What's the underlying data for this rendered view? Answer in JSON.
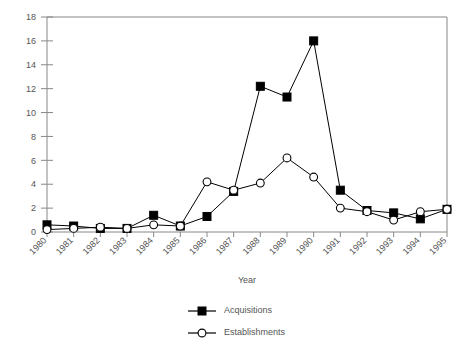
{
  "chart_data": {
    "type": "line",
    "title": "",
    "xlabel": "Year",
    "ylabel": "",
    "categories": [
      "1980",
      "1981",
      "1982",
      "1983",
      "1984",
      "1985",
      "1986",
      "1987",
      "1988",
      "1989",
      "1990",
      "1991",
      "1992",
      "1993",
      "1994",
      "1995"
    ],
    "xlim": [
      "1980",
      "1995"
    ],
    "ylim": [
      0,
      18
    ],
    "yticks": [
      0,
      2,
      4,
      6,
      8,
      10,
      12,
      14,
      16,
      18
    ],
    "grid": false,
    "legend_position": "bottom",
    "series": [
      {
        "name": "Acquisitions",
        "marker": "filled-square",
        "color": "#000000",
        "values": [
          0.6,
          0.5,
          0.3,
          0.3,
          1.4,
          0.5,
          1.3,
          3.4,
          12.2,
          11.3,
          16.0,
          3.5,
          1.8,
          1.6,
          1.1,
          1.9
        ]
      },
      {
        "name": "Establishments",
        "marker": "open-circle",
        "color": "#000000",
        "values": [
          0.2,
          0.3,
          0.4,
          0.3,
          0.6,
          0.5,
          4.2,
          3.5,
          4.1,
          6.2,
          4.6,
          2.0,
          1.7,
          1.0,
          1.7,
          1.9
        ]
      }
    ]
  },
  "axis": {
    "x_title": "Year",
    "y_tick_labels": [
      "0",
      "2",
      "4",
      "6",
      "8",
      "10",
      "12",
      "14",
      "16",
      "18"
    ],
    "x_tick_labels": [
      "1980",
      "1981",
      "1982",
      "1983",
      "1984",
      "1985",
      "1986",
      "1987",
      "1988",
      "1989",
      "1990",
      "1991",
      "1992",
      "1993",
      "1994",
      "1995"
    ]
  },
  "legend": {
    "items": [
      {
        "label": "Acquisitions",
        "marker": "filled-square-icon"
      },
      {
        "label": "Establishments",
        "marker": "open-circle-icon"
      }
    ]
  }
}
